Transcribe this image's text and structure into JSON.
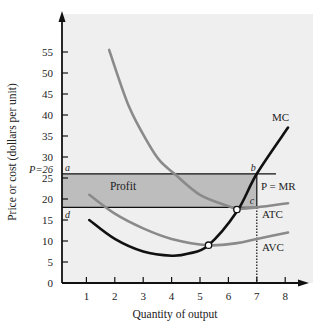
{
  "chart_data": {
    "type": "line",
    "title": "",
    "xlabel": "Quantity of output",
    "ylabel": "Price or cost (dollars per unit)",
    "xlim": [
      0,
      8.5
    ],
    "ylim": [
      0,
      60
    ],
    "x_ticks": [
      1,
      2,
      3,
      4,
      5,
      6,
      7,
      8
    ],
    "y_ticks": [
      0,
      5,
      10,
      15,
      20,
      25,
      30,
      35,
      40,
      45,
      50,
      55
    ],
    "grid": false,
    "legend": "inline labels",
    "price": 26,
    "price_label": "P=26",
    "price_line_label": "P = MR",
    "profit_label": "Profit",
    "profit_rect": {
      "q_from": 0,
      "q_to": 7,
      "p_low": 18,
      "p_high": 26
    },
    "profit_max_quantity": 7,
    "point_labels": {
      "a": "a",
      "b": "b",
      "c": "c",
      "d": "d"
    },
    "series": [
      {
        "name": "MC",
        "color": "#111111",
        "points": [
          [
            1.1,
            15
          ],
          [
            2,
            10.5
          ],
          [
            3,
            7.5
          ],
          [
            4,
            6.5
          ],
          [
            4.6,
            7
          ],
          [
            5.3,
            9
          ],
          [
            6.3,
            17
          ],
          [
            7,
            26
          ],
          [
            8.1,
            37
          ]
        ]
      },
      {
        "name": "ATC",
        "color": "#8a8a8a",
        "points": [
          [
            1.8,
            55.5
          ],
          [
            2.5,
            42
          ],
          [
            3.2,
            33
          ],
          [
            3.6,
            29
          ],
          [
            4.1,
            26
          ],
          [
            5,
            21
          ],
          [
            6,
            18.3
          ],
          [
            6.3,
            17.7
          ],
          [
            7,
            18
          ],
          [
            8.1,
            19
          ]
        ]
      },
      {
        "name": "AVC",
        "color": "#8a8a8a",
        "points": [
          [
            1.1,
            21
          ],
          [
            2,
            16.5
          ],
          [
            3,
            13
          ],
          [
            4,
            10.5
          ],
          [
            5.3,
            9
          ],
          [
            6.3,
            9.5
          ],
          [
            7,
            10.5
          ],
          [
            8.1,
            12
          ]
        ]
      }
    ],
    "intersections": [
      {
        "label": "MC=AVC min",
        "q": 5.3,
        "v": 9
      },
      {
        "label": "MC=ATC min",
        "q": 6.3,
        "v": 17.5
      }
    ]
  }
}
